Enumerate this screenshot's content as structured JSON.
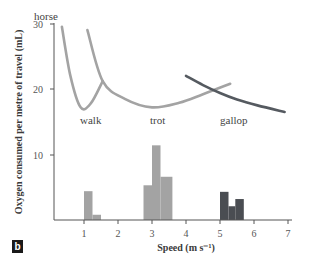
{
  "panel_label": "b",
  "chart_data": {
    "type": "line+bar",
    "title": "",
    "xlabel": "Speed (m s⁻¹)",
    "ylabel": "Oxygen consumed per metre of travel (mL)",
    "xlim": [
      0,
      7
    ],
    "ylim": [
      0,
      30
    ],
    "x_ticks": [
      1,
      2,
      3,
      4,
      5,
      6,
      7
    ],
    "y_ticks": [
      10,
      20,
      30
    ],
    "grid": false,
    "annotations": [
      "horse",
      "walk",
      "trot",
      "gallop"
    ],
    "line_series": [
      {
        "name": "walk",
        "color": "#a3a3a3",
        "x": [
          0.35,
          0.6,
          0.9,
          1.2,
          1.55
        ],
        "y": [
          29.5,
          22,
          17.2,
          17.8,
          21.2
        ]
      },
      {
        "name": "trot",
        "color": "#a3a3a3",
        "x": [
          1.1,
          1.55,
          2.2,
          3.0,
          3.8,
          4.5,
          5.3
        ],
        "y": [
          29,
          21.2,
          18.5,
          17.2,
          17.9,
          19.2,
          20.8
        ]
      },
      {
        "name": "gallop",
        "color": "#555a60",
        "x": [
          4.0,
          4.5,
          5.0,
          5.5,
          6.1,
          6.9
        ],
        "y": [
          22.0,
          20.6,
          19.4,
          18.4,
          17.5,
          16.5
        ]
      }
    ],
    "histogram_series": [
      {
        "name": "walk",
        "color": "#a3a3a3",
        "bins": [
          [
            1.0,
            1.25,
            4.4
          ],
          [
            1.25,
            1.5,
            0.8
          ]
        ]
      },
      {
        "name": "trot",
        "color": "#a3a3a3",
        "bins": [
          [
            2.75,
            3.0,
            5.3
          ],
          [
            3.0,
            3.25,
            11.4
          ],
          [
            3.25,
            3.6,
            6.6
          ]
        ]
      },
      {
        "name": "gallop",
        "color": "#4a4d52",
        "bins": [
          [
            5.0,
            5.25,
            4.3
          ],
          [
            5.25,
            5.45,
            2.1
          ],
          [
            5.45,
            5.7,
            3.2
          ]
        ]
      }
    ]
  }
}
